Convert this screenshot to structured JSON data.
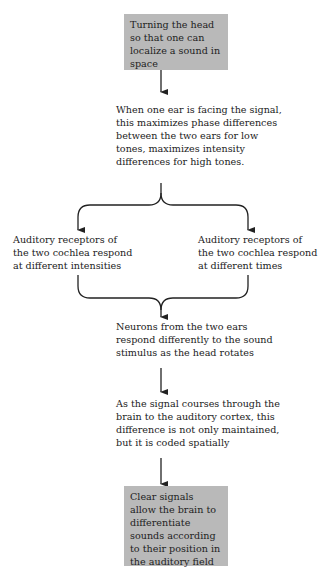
{
  "diagram": {
    "nodes": [
      {
        "id": "n1",
        "text": "Turning the head so that one can localize a sound in space",
        "shaded": true
      },
      {
        "id": "n2",
        "text": "When one ear is facing the signal, this maximizes phase differences between the two ears for low tones, maximizes intensity differences for high tones.",
        "shaded": false
      },
      {
        "id": "n3",
        "text": "Auditory receptors of the two cochlea respond at different intensities",
        "shaded": false
      },
      {
        "id": "n4",
        "text": "Auditory receptors of the two cochlea respond at different times",
        "shaded": false
      },
      {
        "id": "n5",
        "text": "Neurons from the two ears respond differently to the sound stimulus as the head rotates",
        "shaded": false
      },
      {
        "id": "n6",
        "text": "As the signal courses through the brain to the auditory cortex, this difference is not only maintained, but it is coded spatially",
        "shaded": false
      },
      {
        "id": "n7",
        "text": "Clear signals allow the brain to differentiate sounds according to their position in the auditory field",
        "shaded": true
      }
    ],
    "edges": [
      {
        "from": "n1",
        "to": "n2"
      },
      {
        "from": "n2",
        "to": "n3"
      },
      {
        "from": "n2",
        "to": "n4"
      },
      {
        "from": "n3",
        "to": "n5"
      },
      {
        "from": "n4",
        "to": "n5"
      },
      {
        "from": "n5",
        "to": "n6"
      },
      {
        "from": "n6",
        "to": "n7"
      }
    ],
    "colors": {
      "box_fill": "#b9b9b9",
      "line": "#222222"
    }
  }
}
